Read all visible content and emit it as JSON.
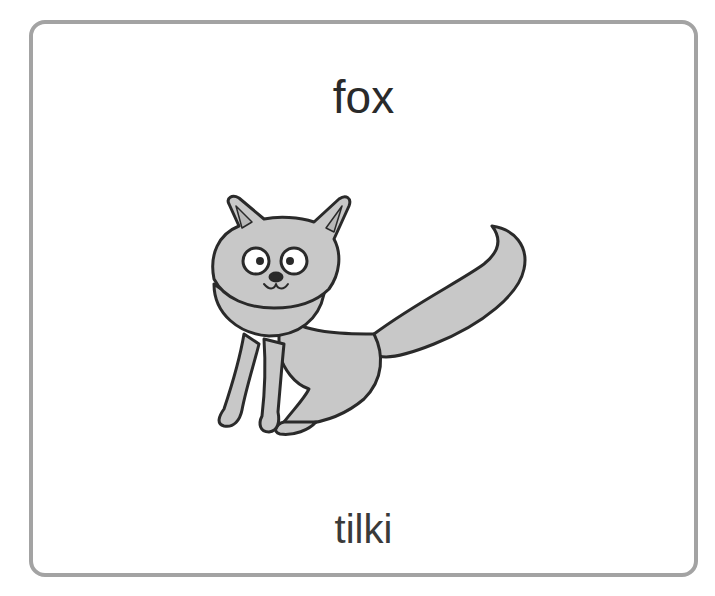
{
  "card": {
    "english_word": "fox",
    "translation": "tilki",
    "illustration": "fox-illustration",
    "border_color": "#a3a3a3",
    "fill_color": "#c8c8c8"
  }
}
